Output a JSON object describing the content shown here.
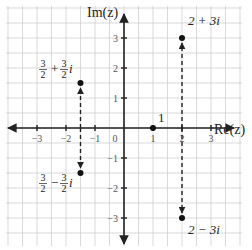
{
  "chart_data": {
    "type": "scatter",
    "title": "",
    "xlabel": "Re(z)",
    "ylabel": "Im(z)",
    "xlim": [
      -4,
      4
    ],
    "ylim": [
      -4,
      4
    ],
    "grid": true,
    "grid_step": 0.5,
    "x_ticks": [
      -3,
      -2,
      -1,
      0,
      1,
      2,
      3
    ],
    "x_tick_labels": [
      "−3",
      "−2",
      "−1",
      "0",
      "1",
      "2",
      "3"
    ],
    "y_ticks": [
      -3,
      -2,
      -1,
      1,
      2,
      3
    ],
    "y_tick_labels": [
      "−3",
      "−2",
      "−1",
      "1",
      "2",
      "3"
    ],
    "points": [
      {
        "name": "2+3i",
        "x": 2,
        "y": 3,
        "label": "2 + 3i"
      },
      {
        "name": "2-3i",
        "x": 2,
        "y": -3,
        "label": "2 − 3i"
      },
      {
        "name": "3/2+3/2i",
        "x": -1.5,
        "y": 1.5,
        "label": "3/2 + 3/2 i"
      },
      {
        "name": "3/2-3/2i",
        "x": -1.5,
        "y": -1.5,
        "label": "3/2 − 3/2 i"
      },
      {
        "name": "1",
        "x": 1,
        "y": 0,
        "label": "1"
      }
    ],
    "conjugate_arrows": [
      {
        "from": [
          2,
          0
        ],
        "to": [
          2,
          3
        ]
      },
      {
        "from": [
          2,
          0
        ],
        "to": [
          2,
          -3
        ]
      },
      {
        "from": [
          -1.5,
          0
        ],
        "to": [
          -1.5,
          1.5
        ]
      },
      {
        "from": [
          -1.5,
          0
        ],
        "to": [
          -1.5,
          -1.5
        ]
      }
    ]
  },
  "labels": {
    "re_axis": "Re(z)",
    "im_axis": "Im(z)",
    "p_2p3i": "2 + 3i",
    "p_2m3i": "2 − 3i",
    "p_one": "1",
    "frac_num": "3",
    "frac_den": "2",
    "plus": "+",
    "minus": "−",
    "i": "i"
  }
}
